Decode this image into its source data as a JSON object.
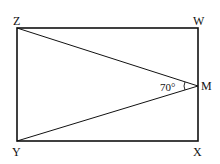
{
  "diagram": {
    "points": {
      "Z": {
        "label": "Z"
      },
      "W": {
        "label": "W"
      },
      "X": {
        "label": "X"
      },
      "Y": {
        "label": "Y"
      },
      "M": {
        "label": "M"
      }
    },
    "angle": {
      "vertex": "M",
      "between": [
        "Z",
        "Y"
      ],
      "label": "70°"
    },
    "segments": [
      "ZW",
      "WX",
      "XY",
      "YZ",
      "ZM",
      "YM"
    ]
  }
}
